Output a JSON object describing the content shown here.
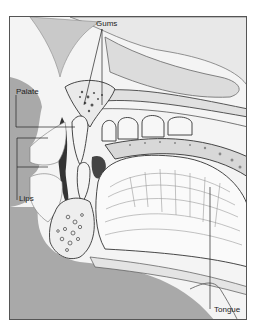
{
  "figure": {
    "labels": {
      "gums": "Gums",
      "palate": "Palate",
      "lips": "Lips",
      "tongue": "Tongue"
    },
    "colors": {
      "background_gray": "#a9a9a9",
      "frame": "#555555",
      "tissue_light": "#f4f4f4",
      "shading": "#8a8a8a",
      "ink": "#222222"
    }
  }
}
